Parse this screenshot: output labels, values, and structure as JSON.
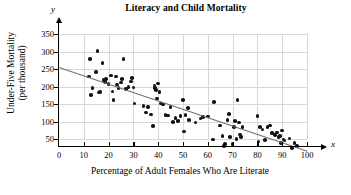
{
  "chart_data": {
    "type": "scatter",
    "title": "Literacy and Child Mortality",
    "xlabel": "Percentage of Adult Females Who Are Literate",
    "ylabel": "Under-Five Mortality (per thousand)",
    "ylabel_line1": "Under-Five Mortality",
    "ylabel_line2": "(per thousand)",
    "x_axis_symbol": "x",
    "y_axis_symbol": "y",
    "xlim": [
      0,
      100
    ],
    "ylim": [
      0,
      350
    ],
    "xticks": [
      0,
      10,
      20,
      30,
      40,
      50,
      60,
      70,
      80,
      90,
      100
    ],
    "yticks": [
      50,
      100,
      150,
      200,
      250,
      300,
      350
    ],
    "grid": true,
    "legend": "none",
    "point_color": "#111111",
    "trend_line_color": "#6e6e6e",
    "grid_color": "#d8d8d8",
    "trend_line": {
      "x_start": 0,
      "y_start": 257,
      "x_end": 100,
      "y_end": 18
    },
    "points": [
      [
        12,
        228
      ],
      [
        12.5,
        278
      ],
      [
        13,
        176
      ],
      [
        13.5,
        195
      ],
      [
        15,
        241
      ],
      [
        15.5,
        302
      ],
      [
        16,
        183
      ],
      [
        16.5,
        185
      ],
      [
        17.5,
        267
      ],
      [
        18,
        218
      ],
      [
        18.5,
        213
      ],
      [
        19,
        221
      ],
      [
        20,
        207
      ],
      [
        21,
        232
      ],
      [
        21.5,
        186
      ],
      [
        22,
        161
      ],
      [
        23,
        229
      ],
      [
        23.5,
        206
      ],
      [
        24,
        196
      ],
      [
        25,
        212
      ],
      [
        25.5,
        222
      ],
      [
        26,
        278
      ],
      [
        27,
        193
      ],
      [
        28,
        199
      ],
      [
        29,
        214
      ],
      [
        29.5,
        224
      ],
      [
        30,
        197
      ],
      [
        30.5,
        152
      ],
      [
        34,
        145
      ],
      [
        35,
        126
      ],
      [
        36,
        141
      ],
      [
        37,
        120
      ],
      [
        38,
        87
      ],
      [
        38.5,
        203
      ],
      [
        38.8,
        196
      ],
      [
        39,
        190
      ],
      [
        39.5,
        166
      ],
      [
        40,
        209
      ],
      [
        40.5,
        185
      ],
      [
        41,
        151
      ],
      [
        42,
        148
      ],
      [
        43,
        118
      ],
      [
        44,
        117
      ],
      [
        45,
        142
      ],
      [
        46,
        99
      ],
      [
        47,
        110
      ],
      [
        48,
        101
      ],
      [
        49,
        115
      ],
      [
        50,
        161
      ],
      [
        50.5,
        71
      ],
      [
        51,
        118
      ],
      [
        52,
        139
      ],
      [
        52.5,
        104
      ],
      [
        55,
        97
      ],
      [
        57,
        108
      ],
      [
        58,
        113
      ],
      [
        60,
        114
      ],
      [
        62,
        49
      ],
      [
        62.5,
        156
      ],
      [
        65,
        88
      ],
      [
        66,
        58
      ],
      [
        66.5,
        30
      ],
      [
        67,
        35
      ],
      [
        68,
        104
      ],
      [
        68.5,
        122
      ],
      [
        69,
        56
      ],
      [
        70,
        36
      ],
      [
        70.5,
        84
      ],
      [
        71,
        101
      ],
      [
        71.5,
        50
      ],
      [
        72,
        162
      ],
      [
        72.5,
        97
      ],
      [
        73,
        63
      ],
      [
        73.5,
        55
      ],
      [
        74,
        85
      ],
      [
        80,
        115
      ],
      [
        80.5,
        43
      ],
      [
        81,
        85
      ],
      [
        82,
        77
      ],
      [
        83,
        47
      ],
      [
        84,
        84
      ],
      [
        85,
        88
      ],
      [
        86,
        67
      ],
      [
        87,
        62
      ],
      [
        88,
        69
      ],
      [
        88.5,
        55
      ],
      [
        89,
        59
      ],
      [
        89.5,
        38
      ],
      [
        90,
        74
      ],
      [
        90.5,
        49
      ],
      [
        91,
        46
      ],
      [
        93,
        52
      ],
      [
        94,
        25
      ],
      [
        95,
        38
      ],
      [
        96,
        30
      ]
    ]
  }
}
